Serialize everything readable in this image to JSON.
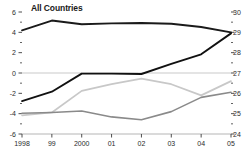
{
  "chart_data": {
    "type": "line",
    "title": "All Countries",
    "xlabel": "",
    "ylabel": "",
    "grid": false,
    "legend_position": "none",
    "x": [
      "1998",
      "99",
      "2000",
      "01",
      "02",
      "03",
      "04",
      "05"
    ],
    "xtick_labels": [
      "1998",
      "99",
      "2000",
      "01",
      "02",
      "03",
      "04",
      "05"
    ],
    "left_axis": {
      "label": "",
      "ylim": [
        -6,
        6
      ],
      "ticks": [
        6,
        4,
        2,
        0,
        -2,
        -4,
        -6
      ],
      "tick_labels": [
        "6",
        "4",
        "2",
        "0",
        "-2",
        "-4",
        "-6"
      ],
      "minor_ticks": [
        5,
        3,
        1,
        -1,
        -3,
        -5
      ]
    },
    "right_axis": {
      "label": "",
      "ylim": [
        24,
        30
      ],
      "ticks": [
        30,
        29,
        28,
        27,
        26,
        25,
        24
      ],
      "tick_labels": [
        "30",
        "29",
        "28",
        "27",
        "26",
        "25",
        "24"
      ],
      "minor_ticks": [
        29.5,
        28.5,
        27.5,
        26.5,
        25.5,
        24.5
      ]
    },
    "zero_line": 0,
    "series": [
      {
        "name": "top-line",
        "axis": "right",
        "color": "#1a1a1a",
        "width": 1.9,
        "values": [
          29.1,
          29.58,
          29.4,
          29.44,
          29.46,
          29.42,
          29.26,
          29.0
        ]
      },
      {
        "name": "dark-rising-line",
        "axis": "right",
        "color": "#111111",
        "width": 1.9,
        "values": [
          25.62,
          26.08,
          26.97,
          26.97,
          26.95,
          27.45,
          27.92,
          28.95
        ]
      },
      {
        "name": "light-gray-line",
        "axis": "right",
        "color": "#c8c8c8",
        "width": 1.7,
        "values": [
          24.92,
          25.06,
          26.12,
          26.45,
          26.72,
          26.45,
          25.9,
          26.6
        ]
      },
      {
        "name": "mid-gray-line",
        "axis": "right",
        "color": "#8a8a8a",
        "width": 1.6,
        "values": [
          25.02,
          25.06,
          25.13,
          24.84,
          24.7,
          25.1,
          25.8,
          26.05
        ]
      }
    ],
    "colors": {
      "axis": "#3a3a3a",
      "zero_line": "#c9c9c9",
      "baseline": "#b5b5b5",
      "text": "#2b2b2b",
      "title": "#1a1a1a"
    }
  }
}
